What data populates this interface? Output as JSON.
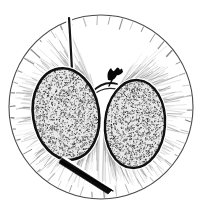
{
  "figure": {
    "title": "Stippled seed pair within circular field",
    "type": "line-illustration",
    "background_color": "#ffffff",
    "ink_color": "#111111",
    "canvas": {
      "width": 202,
      "height": 215
    }
  },
  "frame": {
    "name": "circular-frame",
    "center_x": 101,
    "center_y": 107,
    "radius": 92,
    "stroke_color": "#4a4a4a",
    "stroke_width": 1.1,
    "tick_count": 46,
    "tick_color": "#5a5a5a"
  },
  "seeds": [
    {
      "label": "left-seed",
      "center_x": 66,
      "center_y": 114,
      "radius_x": 33,
      "radius_y": 46,
      "rotation_deg": -9,
      "outline_color": "#101010",
      "outline_width": 2.6,
      "halo_color": "#ffffff",
      "halo_width": 5.0,
      "fill_tone": "#8f8f8f",
      "stipple_density": 2100
    },
    {
      "label": "right-seed",
      "center_x": 135,
      "center_y": 124,
      "radius_x": 30,
      "radius_y": 44,
      "rotation_deg": 4,
      "outline_color": "#101010",
      "outline_width": 2.4,
      "halo_color": "#ffffff",
      "halo_width": 4.6,
      "fill_tone": "#8f8f8f",
      "stipple_density": 1850
    }
  ],
  "stems": {
    "upper_stem": {
      "label": "upper-stem",
      "description": "vertical stalk rising from left seed apex to frame top",
      "stroke_color": "#141414",
      "stroke_width": 2.2
    },
    "lower_stalk": {
      "label": "lower-stalk",
      "description": "tapered stalk descending to lower right from left seed base",
      "stroke_color": "#0c0c0c",
      "stroke_width": 2.0
    },
    "connector": {
      "label": "seed-connector",
      "description": "curved funicle joining the two seeds at center",
      "stroke_color": "#141414",
      "stroke_width": 1.8
    }
  },
  "marker": {
    "label": "dark-apex-marker",
    "center_x": 113,
    "center_y": 76,
    "fill_color": "#080808",
    "description": "small solid dark bract at the apex junction"
  },
  "fibers": {
    "label": "radiating-fibers",
    "count": 420,
    "color": "#6e6e6e",
    "description": "fine hair-like filaments radiating outward from the seeds toward the frame"
  }
}
